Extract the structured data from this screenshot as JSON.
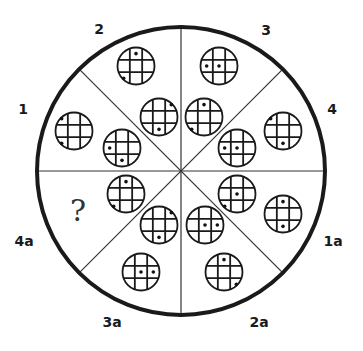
{
  "diagram": {
    "outer_circle": {
      "cx": 181,
      "cy": 171,
      "r": 144,
      "stroke": "#1a1a1a"
    },
    "segment_labels": [
      {
        "id": "2",
        "text": "2",
        "x": 99,
        "y": 29
      },
      {
        "id": "3",
        "text": "3",
        "x": 266,
        "y": 30
      },
      {
        "id": "1",
        "text": "1",
        "x": 23,
        "y": 109
      },
      {
        "id": "4",
        "text": "4",
        "x": 332,
        "y": 109
      },
      {
        "id": "4a",
        "text": "4a",
        "x": 24,
        "y": 241
      },
      {
        "id": "1a",
        "text": "1a",
        "x": 333,
        "y": 241
      },
      {
        "id": "3a",
        "text": "3a",
        "x": 112,
        "y": 322
      },
      {
        "id": "2a",
        "text": "2a",
        "x": 259,
        "y": 322
      }
    ],
    "question_mark": {
      "text": "?",
      "x": 78,
      "y": 210
    },
    "cells": [
      {
        "segment": "2",
        "position": "outer",
        "cx": 136,
        "cy": 66,
        "dots": [
          [
            0,
            1
          ],
          [
            2,
            0
          ]
        ]
      },
      {
        "segment": "2",
        "position": "inner",
        "cx": 159,
        "cy": 117,
        "dots": [
          [
            0,
            2
          ],
          [
            2,
            1
          ]
        ]
      },
      {
        "segment": "3",
        "position": "outer",
        "cx": 219,
        "cy": 66,
        "dots": [
          [
            1,
            0
          ],
          [
            1,
            1
          ]
        ]
      },
      {
        "segment": "3",
        "position": "inner",
        "cx": 204,
        "cy": 117,
        "dots": [
          [
            0,
            1
          ],
          [
            2,
            0
          ]
        ]
      },
      {
        "segment": "1",
        "position": "outer",
        "cx": 74,
        "cy": 131,
        "dots": [
          [
            0,
            0
          ],
          [
            2,
            0
          ]
        ]
      },
      {
        "segment": "1",
        "position": "inner",
        "cx": 122,
        "cy": 148,
        "dots": [
          [
            1,
            0
          ],
          [
            2,
            1
          ]
        ]
      },
      {
        "segment": "4",
        "position": "outer",
        "cx": 283,
        "cy": 131,
        "dots": [
          [
            0,
            0
          ],
          [
            2,
            1
          ]
        ]
      },
      {
        "segment": "4",
        "position": "inner",
        "cx": 237,
        "cy": 148,
        "dots": [
          [
            1,
            0
          ],
          [
            1,
            1
          ]
        ]
      },
      {
        "segment": "4a",
        "position": "inner",
        "cx": 126,
        "cy": 194,
        "dots": [
          [
            0,
            1
          ],
          [
            2,
            0
          ]
        ]
      },
      {
        "segment": "3a",
        "position": "inner",
        "cx": 159,
        "cy": 225,
        "dots": [
          [
            0,
            2
          ],
          [
            2,
            1
          ]
        ]
      },
      {
        "segment": "3a",
        "position": "outer",
        "cx": 141,
        "cy": 272,
        "dots": [
          [
            1,
            1
          ],
          [
            1,
            2
          ]
        ]
      },
      {
        "segment": "2a",
        "position": "inner",
        "cx": 205,
        "cy": 225,
        "dots": [
          [
            1,
            1
          ],
          [
            1,
            2
          ]
        ]
      },
      {
        "segment": "2a",
        "position": "outer",
        "cx": 224,
        "cy": 272,
        "dots": [
          [
            0,
            1
          ],
          [
            2,
            2
          ]
        ]
      },
      {
        "segment": "1a",
        "position": "inner",
        "cx": 237,
        "cy": 194,
        "dots": [
          [
            1,
            1
          ],
          [
            2,
            0
          ]
        ]
      },
      {
        "segment": "1a",
        "position": "outer",
        "cx": 283,
        "cy": 214,
        "dots": [
          [
            0,
            1
          ],
          [
            2,
            1
          ]
        ]
      }
    ],
    "missing": {
      "segment": "4a",
      "position": "outer"
    }
  }
}
